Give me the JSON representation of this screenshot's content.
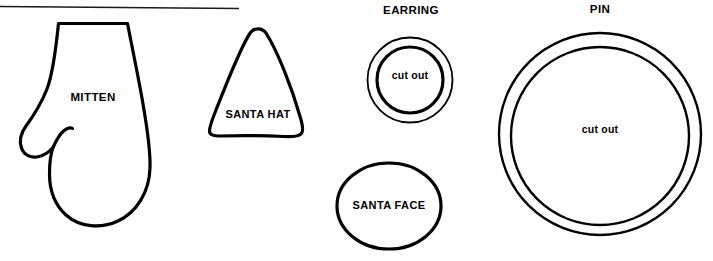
{
  "sheet": {
    "background_color": "#ffffff",
    "ink_color": "#000000",
    "width": 713,
    "height": 261,
    "divider_rule": "horizontal-rule"
  },
  "patterns": {
    "mitten": {
      "label": "MITTEN",
      "shape": "mitten-outline"
    },
    "santa_hat": {
      "label": "SANTA HAT",
      "shape": "rounded-triangle"
    },
    "earring": {
      "title": "EARRING",
      "inner_label": "cut out",
      "shape": "concentric-circles"
    },
    "santa_face": {
      "label": "SANTA FACE",
      "shape": "ellipse"
    },
    "pin": {
      "title": "PIN",
      "inner_label": "cut out",
      "shape": "concentric-circles"
    }
  }
}
